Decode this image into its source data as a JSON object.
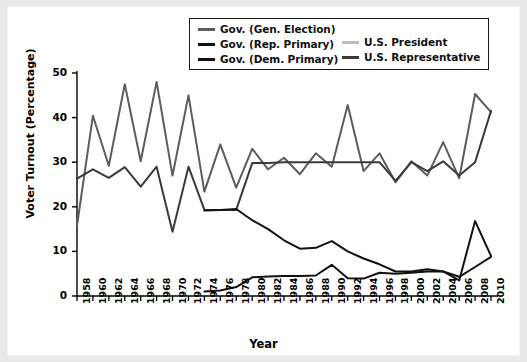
{
  "chart_data": {
    "type": "line",
    "title": "",
    "xlabel": "Year",
    "ylabel": "Voter Turnout (Percentage)",
    "xlim": [
      1958,
      2010
    ],
    "ylim": [
      0,
      50
    ],
    "yticks": [
      0,
      10,
      20,
      30,
      40,
      50
    ],
    "grid": false,
    "legend_position": "top",
    "x": [
      1958,
      1960,
      1962,
      1964,
      1966,
      1968,
      1970,
      1972,
      1974,
      1976,
      1978,
      1980,
      1982,
      1984,
      1986,
      1988,
      1990,
      1992,
      1994,
      1996,
      1998,
      2000,
      2002,
      2004,
      2006,
      2008,
      2010
    ],
    "series": [
      {
        "name": "Gov. (Gen. Election)",
        "color": "#5d5d5d",
        "values": [
          15.8,
          40.4,
          29.2,
          47.5,
          30.2,
          48.0,
          27.0,
          45.0,
          23.4,
          34.0,
          24.3,
          33.0,
          28.4,
          31.0,
          27.3,
          32.0,
          29.0,
          42.8,
          28.0,
          32.0,
          25.5,
          30.2,
          27.0,
          34.5,
          26.4,
          45.3,
          41.2
        ]
      },
      {
        "name": "Gov. (Rep. Primary)",
        "color": "#111111",
        "values": [
          null,
          null,
          null,
          null,
          null,
          null,
          null,
          null,
          1.0,
          1.2,
          2.0,
          4.2,
          4.4,
          4.5,
          4.5,
          4.6,
          7.0,
          4.0,
          3.9,
          5.2,
          5.0,
          5.2,
          5.5,
          5.5,
          3.5,
          16.8,
          9.0
        ]
      },
      {
        "name": "Gov. (Dem. Primary)",
        "color": "#111111",
        "values": [
          null,
          null,
          null,
          null,
          null,
          null,
          null,
          null,
          19.2,
          19.3,
          19.5,
          17.0,
          15.0,
          12.5,
          10.6,
          10.8,
          12.3,
          10.0,
          8.4,
          7.1,
          5.5,
          5.5,
          6.0,
          5.5,
          4.3,
          6.5,
          8.8
        ]
      },
      {
        "name": "U.S. President",
        "color": "#bdbdbd",
        "values": [
          null,
          42.0,
          null,
          45.0,
          null,
          48.5,
          null,
          46.0,
          null,
          45.0,
          null,
          44.0,
          null,
          46.6,
          null,
          45.3,
          null,
          46.5,
          null,
          42.8,
          null,
          43.0,
          null,
          44.6,
          null,
          46.0,
          null
        ]
      },
      {
        "name": "U.S. Representative",
        "color": "#3a3a3a",
        "values": [
          26.3,
          28.4,
          26.5,
          28.9,
          24.5,
          29.0,
          14.4,
          29.0,
          19.3,
          19.3,
          19.3,
          29.8,
          29.8,
          30.0,
          30.0,
          30.0,
          30.0,
          30.0,
          30.0,
          30.0,
          25.8,
          30.0,
          28.0,
          30.2,
          27.0,
          30.0,
          41.5
        ]
      }
    ]
  },
  "legend": {
    "entries": [
      {
        "label": "Gov. (Gen. Election)",
        "color": "#5d5d5d"
      },
      {
        "label": "Gov. (Rep. Primary)",
        "color": "#111111"
      },
      {
        "label": "Gov. (Dem. Primary)",
        "color": "#111111"
      },
      {
        "label": "U.S. President",
        "color": "#bdbdbd"
      },
      {
        "label": "U.S. Representative",
        "color": "#3a3a3a"
      }
    ]
  }
}
